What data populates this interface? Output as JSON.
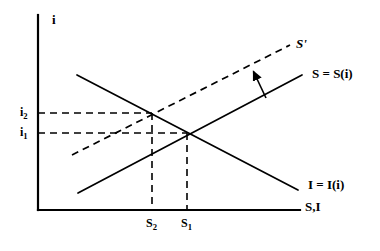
{
  "figure": {
    "type": "economics-diagram",
    "background_color": "#ffffff",
    "line_color": "#000000"
  },
  "axes": {
    "y_label": "i",
    "x_label": "S,I",
    "origin": {
      "x": 38,
      "y": 210
    },
    "y_top": {
      "x": 38,
      "y": 15
    },
    "x_right": {
      "x": 300,
      "y": 210
    }
  },
  "curves": [
    {
      "name": "savings-curve",
      "label": "S = S(i)",
      "style": "solid",
      "x1": 78,
      "y1": 193,
      "x2": 302,
      "y2": 75
    },
    {
      "name": "savings-curve-shifted",
      "label": "S'",
      "style": "dashed",
      "x1": 72,
      "y1": 155,
      "x2": 290,
      "y2": 45
    },
    {
      "name": "investment-curve",
      "label": "I = I(i)",
      "style": "solid",
      "x1": 77,
      "y1": 75,
      "x2": 298,
      "y2": 190
    }
  ],
  "equilibria": [
    {
      "name": "equilibrium-2",
      "x_label": "S2",
      "x_sub": "2",
      "y_label": "i2",
      "y_sub": "2",
      "x": 152,
      "y": 113
    },
    {
      "name": "equilibrium-1",
      "x_label": "S1",
      "x_sub": "1",
      "y_label": "i1",
      "y_sub": "1",
      "x": 187,
      "y": 133
    }
  ],
  "annotations": {
    "shift_arrow": {
      "name": "shift-arrow",
      "from": {
        "x": 266,
        "y": 98
      },
      "to": {
        "x": 252,
        "y": 69
      },
      "description": "arrow indicating upward shift of savings curve"
    }
  },
  "labels": {
    "y_axis": "i",
    "x_axis": "S,I",
    "savings": "S = S(i)",
    "savings_shifted": "S'",
    "investment": "I = I(i)",
    "i2_base": "i",
    "i2_sub": "2",
    "i1_base": "i",
    "i1_sub": "1",
    "s2_base": "S",
    "s2_sub": "2",
    "s1_base": "S",
    "s1_sub": "1"
  }
}
